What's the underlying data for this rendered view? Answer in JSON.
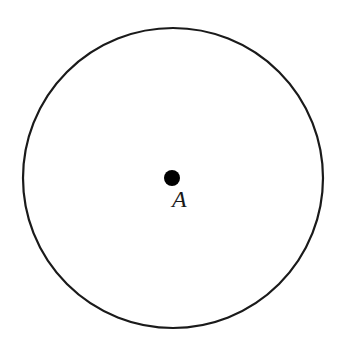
{
  "diagram": {
    "type": "circle-with-center",
    "circle": {
      "cx": 173,
      "cy": 178,
      "r": 150,
      "stroke": "#1a1a1a",
      "stroke_width": 2.2
    },
    "center_point": {
      "cx": 172,
      "cy": 178,
      "r": 8,
      "fill": "#000000"
    },
    "center_label": {
      "text": "A",
      "x": 172,
      "y": 207
    }
  }
}
